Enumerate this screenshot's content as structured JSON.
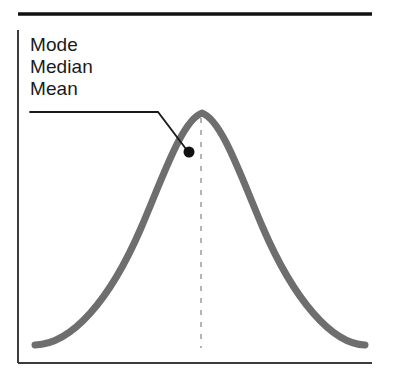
{
  "figure": {
    "title": "",
    "caption": "",
    "background_color": "#ffffff",
    "width": 397,
    "height": 375
  },
  "annotation": {
    "labels": [
      {
        "text": "Mode"
      },
      {
        "text": "Median"
      },
      {
        "text": "Mean"
      }
    ],
    "leader_line": {
      "color": "#1a1a1a",
      "points": "30,112 158,112 186,149"
    },
    "marker_dot": {
      "color": "#111111",
      "cx": 189,
      "cy": 152,
      "r": 5.5
    }
  },
  "axes": {
    "top_rule": {
      "color": "#111111",
      "x1": 18,
      "y1": 14,
      "x2": 372,
      "y2": 14,
      "width": 3.4
    },
    "y_axis": {
      "color": "#3c3c3c",
      "x1": 18,
      "y1": 30,
      "x2": 18,
      "y2": 363,
      "width": 2
    },
    "x_axis": {
      "color": "#3c3c3c",
      "x1": 18,
      "y1": 363,
      "x2": 372,
      "y2": 363,
      "width": 2
    },
    "x_tick_labels": [],
    "y_tick_labels": [],
    "xlabel": "",
    "ylabel": "",
    "grid": false
  },
  "center_line": {
    "name": "center-dashed-line",
    "color": "#b3b3b3",
    "x": 201,
    "y_top": 118,
    "y_bottom": 348,
    "dash_on": 5,
    "dash_off": 7,
    "width": 2
  },
  "chart_data": {
    "type": "line",
    "xlabel": "",
    "ylabel": "",
    "grid": false,
    "legend_position": "inside-top-left",
    "series": [
      {
        "name": "normal-curve",
        "color": "#6e6e6e",
        "stroke_width": 7,
        "description": "Bell-shaped symmetric normal density curve",
        "path": "M 35 345 C 72 344, 110 300, 141 228 C 163 177, 182 120, 202 113 C 222 120, 241 177, 263 228 C 294 300, 332 344, 365 345",
        "x": [
          35,
          72,
          110,
          141,
          163,
          182,
          202,
          222,
          241,
          263,
          294,
          332,
          365
        ],
        "y": [
          345,
          344,
          300,
          228,
          177,
          120,
          113,
          120,
          177,
          228,
          300,
          344,
          345
        ]
      }
    ],
    "annotations": [
      {
        "text": "Mode",
        "points_to_x": 202,
        "points_to_y": 113,
        "note": "At the distribution peak"
      },
      {
        "text": "Median",
        "points_to_x": 202,
        "points_to_y": 113,
        "note": "At the distribution peak"
      },
      {
        "text": "Mean",
        "points_to_x": 202,
        "points_to_y": 113,
        "note": "At the distribution peak"
      }
    ],
    "xlim": [
      18,
      372
    ],
    "ylim": [
      363,
      113
    ]
  }
}
